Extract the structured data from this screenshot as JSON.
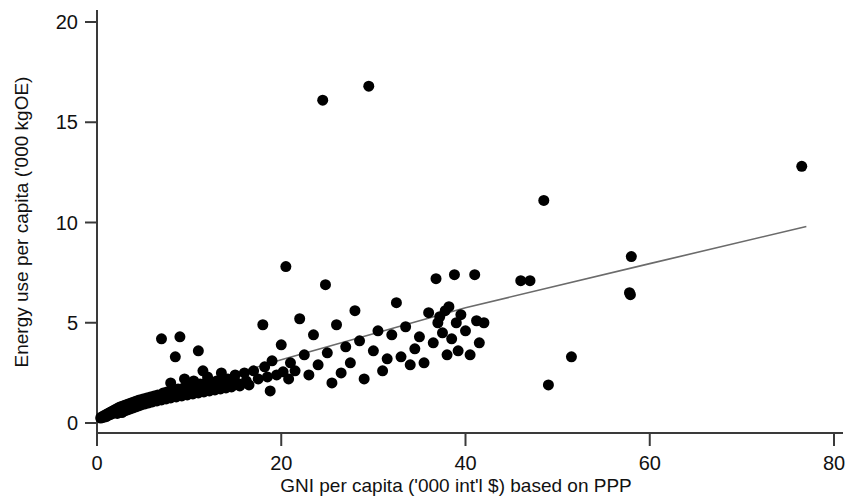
{
  "chart_data": {
    "type": "scatter",
    "title": "",
    "xlabel": "GNI per capita ('000 int'l $) based on PPP",
    "ylabel": "Energy use per capita ('000 kgOE)",
    "xlim": [
      0,
      80
    ],
    "ylim": [
      0,
      20
    ],
    "xticks": [
      0,
      20,
      40,
      60,
      80
    ],
    "yticks": [
      0,
      5,
      10,
      15,
      20
    ],
    "xtick_labels": [
      "0",
      "20",
      "40",
      "60",
      "80"
    ],
    "ytick_labels": [
      "0",
      "5",
      "10",
      "15",
      "20"
    ],
    "grid": false,
    "legend": null,
    "marker": {
      "shape": "circle",
      "color": "#000000",
      "size": 8
    },
    "points": [
      [
        0.4,
        0.25
      ],
      [
        0.5,
        0.3
      ],
      [
        0.6,
        0.28
      ],
      [
        0.7,
        0.35
      ],
      [
        0.8,
        0.3
      ],
      [
        0.9,
        0.4
      ],
      [
        1.0,
        0.32
      ],
      [
        1.1,
        0.45
      ],
      [
        1.2,
        0.38
      ],
      [
        1.3,
        0.5
      ],
      [
        1.4,
        0.42
      ],
      [
        1.5,
        0.55
      ],
      [
        1.6,
        0.45
      ],
      [
        1.7,
        0.6
      ],
      [
        1.8,
        0.5
      ],
      [
        1.9,
        0.65
      ],
      [
        2.0,
        0.55
      ],
      [
        2.1,
        0.7
      ],
      [
        2.2,
        0.48
      ],
      [
        2.3,
        0.75
      ],
      [
        2.4,
        0.6
      ],
      [
        2.5,
        0.8
      ],
      [
        2.6,
        0.65
      ],
      [
        2.7,
        0.52
      ],
      [
        2.8,
        0.85
      ],
      [
        2.9,
        0.7
      ],
      [
        3.0,
        0.6
      ],
      [
        3.1,
        0.9
      ],
      [
        3.2,
        0.72
      ],
      [
        3.3,
        0.65
      ],
      [
        3.4,
        0.95
      ],
      [
        3.5,
        0.8
      ],
      [
        3.6,
        0.7
      ],
      [
        3.7,
        1.0
      ],
      [
        3.8,
        0.85
      ],
      [
        3.9,
        0.75
      ],
      [
        4.0,
        1.05
      ],
      [
        4.1,
        0.9
      ],
      [
        4.2,
        0.8
      ],
      [
        4.3,
        1.1
      ],
      [
        4.4,
        0.95
      ],
      [
        4.5,
        0.85
      ],
      [
        4.6,
        1.15
      ],
      [
        4.7,
        1.0
      ],
      [
        4.8,
        0.9
      ],
      [
        5.0,
        1.2
      ],
      [
        5.1,
        1.05
      ],
      [
        5.2,
        0.95
      ],
      [
        5.4,
        1.25
      ],
      [
        5.5,
        1.1
      ],
      [
        5.6,
        1.0
      ],
      [
        5.8,
        1.3
      ],
      [
        5.9,
        1.15
      ],
      [
        6.0,
        1.05
      ],
      [
        6.2,
        1.35
      ],
      [
        6.3,
        1.2
      ],
      [
        6.5,
        1.1
      ],
      [
        6.6,
        1.4
      ],
      [
        6.8,
        1.25
      ],
      [
        7.0,
        1.15
      ],
      [
        7.0,
        4.2
      ],
      [
        7.2,
        1.5
      ],
      [
        7.3,
        1.3
      ],
      [
        7.5,
        1.2
      ],
      [
        7.6,
        1.55
      ],
      [
        7.8,
        1.35
      ],
      [
        8.0,
        1.25
      ],
      [
        8.0,
        2.0
      ],
      [
        8.2,
        1.6
      ],
      [
        8.4,
        1.4
      ],
      [
        8.5,
        3.3
      ],
      [
        8.6,
        1.3
      ],
      [
        8.8,
        1.7
      ],
      [
        9.0,
        1.45
      ],
      [
        9.0,
        4.3
      ],
      [
        9.2,
        1.35
      ],
      [
        9.4,
        1.75
      ],
      [
        9.5,
        2.2
      ],
      [
        9.6,
        1.5
      ],
      [
        9.8,
        1.4
      ],
      [
        10.0,
        1.85
      ],
      [
        10.2,
        1.55
      ],
      [
        10.4,
        1.45
      ],
      [
        10.5,
        2.1
      ],
      [
        10.6,
        1.9
      ],
      [
        10.8,
        1.6
      ],
      [
        11.0,
        1.5
      ],
      [
        11.0,
        3.6
      ],
      [
        11.2,
        1.95
      ],
      [
        11.4,
        1.65
      ],
      [
        11.5,
        2.6
      ],
      [
        11.6,
        1.55
      ],
      [
        11.8,
        2.0
      ],
      [
        12.0,
        1.7
      ],
      [
        12.0,
        2.3
      ],
      [
        12.2,
        1.6
      ],
      [
        12.4,
        2.05
      ],
      [
        12.6,
        1.75
      ],
      [
        12.8,
        1.65
      ],
      [
        13.0,
        2.1
      ],
      [
        13.2,
        1.8
      ],
      [
        13.4,
        1.7
      ],
      [
        13.5,
        2.5
      ],
      [
        13.6,
        2.15
      ],
      [
        13.8,
        1.85
      ],
      [
        14.0,
        1.75
      ],
      [
        14.2,
        2.2
      ],
      [
        14.5,
        1.9
      ],
      [
        14.6,
        1.8
      ],
      [
        15.0,
        2.4
      ],
      [
        15.2,
        2.0
      ],
      [
        15.5,
        1.85
      ],
      [
        16.0,
        2.5
      ],
      [
        16.2,
        2.1
      ],
      [
        16.5,
        1.9
      ],
      [
        17.0,
        2.6
      ],
      [
        17.5,
        2.2
      ],
      [
        18.0,
        4.9
      ],
      [
        18.2,
        2.8
      ],
      [
        18.5,
        2.3
      ],
      [
        18.8,
        1.6
      ],
      [
        19.0,
        3.1
      ],
      [
        19.5,
        2.4
      ],
      [
        20.0,
        3.9
      ],
      [
        20.2,
        2.55
      ],
      [
        20.5,
        7.8
      ],
      [
        20.8,
        2.2
      ],
      [
        21.0,
        3.0
      ],
      [
        21.5,
        2.6
      ],
      [
        22.0,
        5.2
      ],
      [
        22.5,
        3.4
      ],
      [
        23.0,
        2.4
      ],
      [
        23.5,
        4.4
      ],
      [
        24.0,
        2.9
      ],
      [
        24.5,
        16.1
      ],
      [
        24.8,
        6.9
      ],
      [
        25.0,
        3.5
      ],
      [
        25.5,
        2.0
      ],
      [
        26.0,
        4.9
      ],
      [
        26.5,
        2.5
      ],
      [
        27.0,
        3.8
      ],
      [
        27.5,
        3.0
      ],
      [
        28.0,
        5.6
      ],
      [
        28.5,
        4.1
      ],
      [
        29.0,
        2.2
      ],
      [
        29.5,
        16.8
      ],
      [
        30.0,
        3.6
      ],
      [
        30.5,
        4.6
      ],
      [
        31.0,
        2.6
      ],
      [
        31.5,
        3.2
      ],
      [
        32.0,
        4.4
      ],
      [
        32.5,
        6.0
      ],
      [
        33.0,
        3.3
      ],
      [
        33.5,
        4.8
      ],
      [
        34.0,
        2.9
      ],
      [
        34.5,
        3.7
      ],
      [
        35.0,
        4.3
      ],
      [
        35.5,
        3.0
      ],
      [
        36.0,
        5.5
      ],
      [
        36.5,
        4.0
      ],
      [
        36.8,
        7.2
      ],
      [
        37.0,
        5.0
      ],
      [
        37.2,
        5.3
      ],
      [
        37.5,
        4.5
      ],
      [
        37.8,
        5.6
      ],
      [
        38.0,
        3.4
      ],
      [
        38.2,
        5.8
      ],
      [
        38.5,
        4.2
      ],
      [
        38.8,
        7.4
      ],
      [
        39.0,
        5.0
      ],
      [
        39.2,
        3.6
      ],
      [
        39.5,
        5.4
      ],
      [
        40.0,
        4.6
      ],
      [
        40.5,
        3.4
      ],
      [
        41.0,
        7.4
      ],
      [
        41.2,
        5.1
      ],
      [
        41.5,
        4.0
      ],
      [
        42.0,
        5.0
      ],
      [
        46.0,
        7.1
      ],
      [
        47.0,
        7.1
      ],
      [
        48.5,
        11.1
      ],
      [
        49.0,
        1.9
      ],
      [
        51.5,
        3.3
      ],
      [
        57.8,
        6.5
      ],
      [
        57.9,
        6.4
      ],
      [
        58.0,
        8.3
      ],
      [
        76.5,
        12.8
      ]
    ],
    "trend_line": {
      "type": "fitted",
      "color": "#6b6b6b",
      "points": [
        [
          0.3,
          0.45
        ],
        [
          20.0,
          3.15
        ],
        [
          40.0,
          5.75
        ],
        [
          60.0,
          7.95
        ],
        [
          77.0,
          9.8
        ]
      ]
    }
  }
}
